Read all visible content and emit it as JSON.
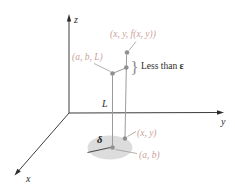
{
  "figure": {
    "axes": {
      "x_label": "x",
      "y_label": "y",
      "z_label": "z"
    },
    "points": {
      "surface_point_label": "(x, y, f(x, y))",
      "limit_point_label": "(a, b, L)",
      "domain_point_label": "(x, y)",
      "center_point_label": "(a, b)"
    },
    "annotations": {
      "epsilon_text": "Less than ",
      "epsilon_symbol": "ε",
      "limit_value_label": "L",
      "delta_symbol": "δ",
      "brace_glyph": "}"
    },
    "colors": {
      "label_rose": "#cc9f98",
      "line_gray": "#9b9b9b",
      "dot_gray": "#8e9093",
      "disk_fill": "#dcdcdc",
      "ink": "#2b2b2b"
    }
  }
}
